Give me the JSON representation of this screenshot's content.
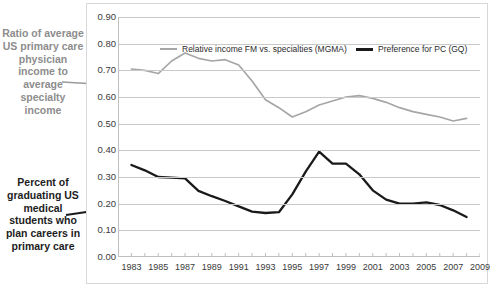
{
  "annotations": {
    "income_label": "Ratio of average US primary care physician income to average specialty income",
    "students_label": "Percent of graduating US medical students who plan careers in primary care",
    "income_color": "#8d8d8d",
    "students_color": "#1d1d1d"
  },
  "legend": {
    "position": "top-inside",
    "items": [
      {
        "label": "Relative income FM vs. specialties (MGMA)",
        "color": "#a6a6a6"
      },
      {
        "label": "Preference for PC (GQ)",
        "color": "#1a1a1a"
      }
    ]
  },
  "axes": {
    "y_ticks": [
      "0.90",
      "0.80",
      "0.70",
      "0.60",
      "0.50",
      "0.40",
      "0.30",
      "0.20",
      "0.10",
      "0.00"
    ],
    "x_ticks": [
      "1983",
      "1985",
      "1987",
      "1989",
      "1991",
      "1993",
      "1995",
      "1997",
      "1999",
      "2001",
      "2003",
      "2005",
      "2007",
      "2009"
    ]
  },
  "chart_data": {
    "type": "line",
    "title": "",
    "xlabel": "",
    "ylabel": "",
    "xlim": [
      1982,
      2009
    ],
    "ylim": [
      0.0,
      0.9
    ],
    "grid": true,
    "legend_position": "top-inside",
    "x": [
      1983,
      1984,
      1985,
      1986,
      1987,
      1988,
      1989,
      1990,
      1991,
      1992,
      1993,
      1994,
      1995,
      1996,
      1997,
      1998,
      1999,
      2000,
      2001,
      2002,
      2003,
      2004,
      2005,
      2006,
      2007,
      2008
    ],
    "series": [
      {
        "name": "Relative income FM vs. specialties (MGMA)",
        "color": "#a6a6a6",
        "values": [
          0.705,
          0.7,
          0.688,
          0.735,
          0.765,
          0.745,
          0.735,
          0.74,
          0.72,
          0.66,
          0.59,
          0.56,
          0.525,
          0.545,
          0.57,
          0.585,
          0.6,
          0.605,
          0.595,
          0.58,
          0.56,
          0.545,
          0.535,
          0.525,
          0.51,
          0.52
        ]
      },
      {
        "name": "Preference for PC (GQ)",
        "color": "#1a1a1a",
        "values": [
          0.345,
          0.325,
          0.3,
          0.298,
          0.295,
          0.248,
          0.228,
          0.21,
          0.19,
          0.17,
          0.165,
          0.168,
          0.235,
          0.32,
          0.395,
          0.35,
          0.35,
          0.31,
          0.25,
          0.215,
          0.2,
          0.2,
          0.205,
          0.195,
          0.175,
          0.15
        ]
      }
    ]
  }
}
